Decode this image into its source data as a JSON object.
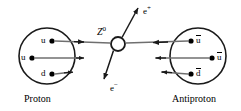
{
  "figure": {
    "width": 241,
    "height": 111,
    "background": "#ffffff",
    "line_color_dark": "#1a1a1a",
    "line_color_grey": "#7a7a7a"
  },
  "proton": {
    "name_label": "Proton",
    "circle": {
      "cx": 47,
      "cy": 56,
      "r": 28
    },
    "quarks": [
      {
        "id": "u-top",
        "label": "u",
        "dot_x": 52,
        "dot_y": 41,
        "label_x": 41,
        "label_y": 37
      },
      {
        "id": "u-mid",
        "label": "u",
        "dot_x": 32,
        "dot_y": 58,
        "label_x": 21,
        "label_y": 54
      },
      {
        "id": "d-bot",
        "label": "d",
        "dot_x": 52,
        "dot_y": 74,
        "label_x": 41,
        "label_y": 70
      }
    ]
  },
  "antiproton": {
    "name_label": "Antiproton",
    "circle": {
      "cx": 198,
      "cy": 56,
      "r": 28
    },
    "quarks": [
      {
        "id": "ubar-top",
        "label": "u",
        "overline": true,
        "dot_x": 191,
        "dot_y": 41,
        "label_x": 196,
        "label_y": 37
      },
      {
        "id": "ubar-mid",
        "label": "u",
        "overline": true,
        "dot_x": 212,
        "dot_y": 58,
        "label_x": 217,
        "label_y": 54
      },
      {
        "id": "dbar-bot",
        "label": "d",
        "overline": true,
        "dot_x": 191,
        "dot_y": 74,
        "label_x": 196,
        "label_y": 70
      }
    ]
  },
  "boson": {
    "label": "Z",
    "superscript": "0",
    "label_x": 97,
    "label_y": 27,
    "vertex": {
      "cx": 118,
      "cy": 44,
      "r": 7
    }
  },
  "leptons": [
    {
      "id": "positron",
      "label": "e",
      "superscript": "+",
      "label_x": 143,
      "label_y": 6,
      "direction": "up-right"
    },
    {
      "id": "electron",
      "label": "e",
      "superscript": "−",
      "label_x": 110,
      "label_y": 83,
      "direction": "down-left"
    }
  ],
  "tracks": [
    {
      "id": "proton-u-top-track",
      "from": "u-top",
      "to": "vertex",
      "direction": "right",
      "color": "dark"
    },
    {
      "id": "proton-u-mid-track",
      "from": "u-mid",
      "to": "stub",
      "direction": "right",
      "color": "grey"
    },
    {
      "id": "proton-d-bot-track",
      "from": "d-bot",
      "to": "stub",
      "direction": "right",
      "color": "dark"
    },
    {
      "id": "antiproton-ubar-top-track",
      "from": "ubar-top",
      "to": "vertex",
      "direction": "left",
      "color": "dark"
    },
    {
      "id": "antiproton-ubar-mid-track",
      "from": "ubar-mid",
      "to": "stub",
      "direction": "left",
      "color": "grey"
    },
    {
      "id": "antiproton-dbar-bot-track",
      "from": "dbar-bot",
      "to": "stub",
      "direction": "left",
      "color": "dark"
    }
  ]
}
